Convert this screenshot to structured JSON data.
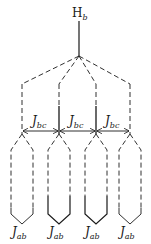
{
  "diagram": {
    "root": {
      "label": "H",
      "subscript": "b"
    },
    "columns": [
      {
        "x": 22,
        "bottom_label": {
          "label": "J",
          "subscript": "ab"
        }
      },
      {
        "x": 59,
        "bottom_label": {
          "label": "J",
          "subscript": "ab"
        }
      },
      {
        "x": 96,
        "bottom_label": {
          "label": "J",
          "subscript": "ab"
        }
      },
      {
        "x": 130,
        "bottom_label": {
          "label": "J",
          "subscript": "ab"
        }
      }
    ],
    "couplings": [
      {
        "from": 0,
        "to": 1,
        "label": "J",
        "subscript": "bc"
      },
      {
        "from": 1,
        "to": 2,
        "label": "J",
        "subscript": "bc"
      },
      {
        "from": 2,
        "to": 3,
        "label": "J",
        "subscript": "bc"
      }
    ],
    "colors": {
      "line": "#1a1a1a",
      "background": "#ffffff"
    }
  }
}
